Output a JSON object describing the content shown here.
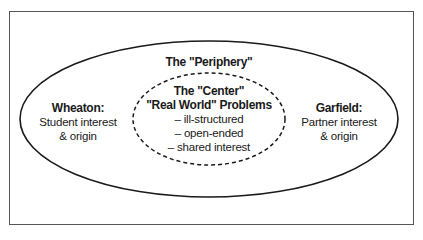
{
  "diagram": {
    "periphery": {
      "title": "The \"Periphery\"",
      "shape": "solid-ellipse"
    },
    "center": {
      "title": "The \"Center\"",
      "subtitle": "\"Real World\" Problems",
      "items": [
        "– ill-structured",
        "– open-ended",
        "– shared interest"
      ],
      "shape": "dashed-ellipse"
    },
    "left": {
      "title": "Wheaton:",
      "lines": [
        "Student interest",
        "& origin"
      ]
    },
    "right": {
      "title": "Garfield:",
      "lines": [
        "Partner interest",
        "& origin"
      ]
    },
    "colors": {
      "stroke": "#1a1a1a",
      "frame": "#555555",
      "background": "#ffffff",
      "text": "#1a1a1a"
    }
  }
}
